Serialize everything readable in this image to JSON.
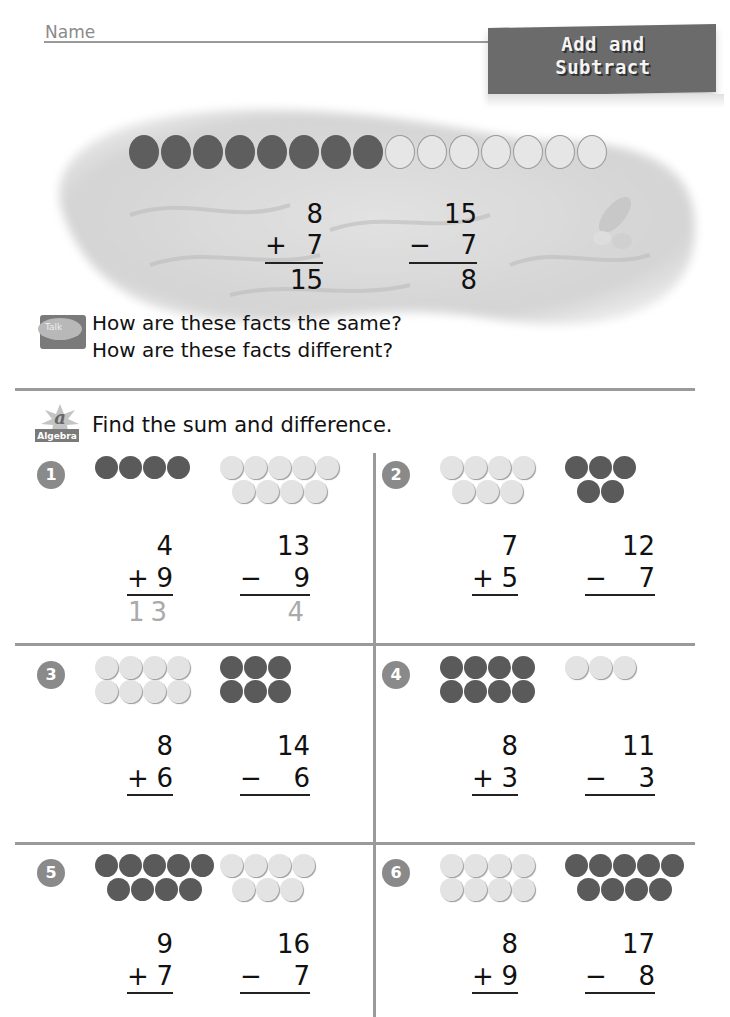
{
  "header": {
    "name_label": "Name",
    "title_line1": "Add and",
    "title_line2": "Subtract"
  },
  "intro": {
    "counters": {
      "dark": 8,
      "light": 7
    },
    "addition": {
      "top": "8",
      "op": "+",
      "bottom": "7",
      "answer": "15"
    },
    "subtraction": {
      "top": "15",
      "op": "−",
      "bottom": "7",
      "answer": "8"
    },
    "decoration": "seashell-icon"
  },
  "talk": {
    "icon_label": "Talk",
    "line1": "How are these facts the same?",
    "line2": "How are these facts different?"
  },
  "algebra": {
    "icon_label": "Algebra",
    "icon_letter": "a",
    "instruction": "Find the sum and difference."
  },
  "problems": [
    {
      "n": "1",
      "add": {
        "top": "4",
        "bottom": "9",
        "answer": "13"
      },
      "sub": {
        "top": "13",
        "bottom": "9",
        "answer": "4"
      },
      "left_counters": {
        "color": "dark",
        "rows": [
          4
        ]
      },
      "right_counters": {
        "color": "light",
        "rows": [
          5,
          4
        ]
      }
    },
    {
      "n": "2",
      "add": {
        "top": "7",
        "bottom": "5",
        "answer": ""
      },
      "sub": {
        "top": "12",
        "bottom": "7",
        "answer": ""
      },
      "left_counters": {
        "color": "light",
        "rows": [
          4,
          3
        ]
      },
      "right_counters": {
        "color": "dark",
        "rows": [
          3,
          2
        ]
      }
    },
    {
      "n": "3",
      "add": {
        "top": "8",
        "bottom": "6",
        "answer": ""
      },
      "sub": {
        "top": "14",
        "bottom": "6",
        "answer": ""
      },
      "left_counters": {
        "color": "light",
        "rows": [
          4,
          4
        ]
      },
      "right_counters": {
        "color": "dark",
        "rows": [
          3,
          3
        ]
      }
    },
    {
      "n": "4",
      "add": {
        "top": "8",
        "bottom": "3",
        "answer": ""
      },
      "sub": {
        "top": "11",
        "bottom": "3",
        "answer": ""
      },
      "left_counters": {
        "color": "dark",
        "rows": [
          4,
          4
        ]
      },
      "right_counters": {
        "color": "light",
        "rows": [
          3
        ]
      }
    },
    {
      "n": "5",
      "add": {
        "top": "9",
        "bottom": "7",
        "answer": ""
      },
      "sub": {
        "top": "16",
        "bottom": "7",
        "answer": ""
      },
      "left_counters": {
        "color": "dark",
        "rows": [
          5,
          4
        ]
      },
      "right_counters": {
        "color": "light",
        "rows": [
          4,
          3
        ]
      }
    },
    {
      "n": "6",
      "add": {
        "top": "8",
        "bottom": "9",
        "answer": ""
      },
      "sub": {
        "top": "17",
        "bottom": "8",
        "answer": ""
      },
      "left_counters": {
        "color": "light",
        "rows": [
          4,
          4
        ]
      },
      "right_counters": {
        "color": "dark",
        "rows": [
          5,
          4
        ]
      }
    }
  ],
  "ops": {
    "plus": "+",
    "minus": "−"
  },
  "colors": {
    "dark_counter": "#5e5e5e",
    "light_counter": "#e4e4e4",
    "tab": "#6b6b6b",
    "rule": "#9a9a9a"
  }
}
